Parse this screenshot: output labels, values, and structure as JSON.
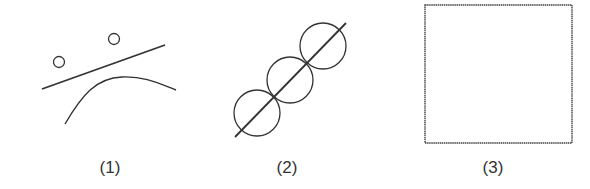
{
  "figures": [
    {
      "label": "(1)",
      "description": "two small circles above a straight line, with a curve below"
    },
    {
      "label": "(2)",
      "description": "three equal circles threaded along a diagonal line"
    },
    {
      "label": "(3)",
      "description": "an empty square"
    }
  ],
  "colors": {
    "stroke": "#333333",
    "background": "#ffffff"
  }
}
